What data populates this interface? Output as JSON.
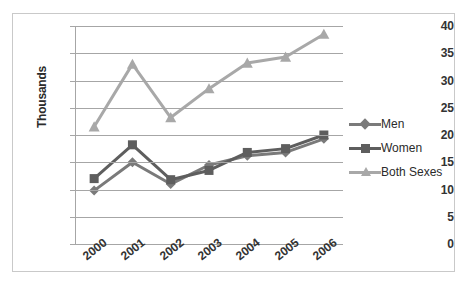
{
  "chart_data": {
    "type": "line",
    "title": "",
    "xlabel": "",
    "ylabel": "Thousands",
    "categories": [
      "2000",
      "2001",
      "2002",
      "2003",
      "2004",
      "2005",
      "2006"
    ],
    "ylim": [
      0,
      40
    ],
    "ytick_step": 5,
    "yticks": [
      "0",
      "5",
      "10",
      "15",
      "20",
      "25",
      "30",
      "35",
      "40"
    ],
    "grid": true,
    "legend_position": "right",
    "series": [
      {
        "name": "Men",
        "marker": "diamond",
        "color": "#7a7a7a",
        "values": [
          9.8,
          15.0,
          11.0,
          14.5,
          16.2,
          16.8,
          19.3
        ]
      },
      {
        "name": "Women",
        "marker": "square",
        "color": "#5e5e5e",
        "values": [
          12.0,
          18.2,
          11.8,
          13.5,
          16.8,
          17.5,
          20.0
        ]
      },
      {
        "name": "Both Sexes",
        "marker": "triangle",
        "color": "#a8a8a8",
        "values": [
          21.5,
          33.0,
          23.2,
          28.5,
          33.2,
          34.3,
          38.5
        ]
      }
    ]
  },
  "colors": {
    "men": "#7a7a7a",
    "women": "#5e5e5e",
    "both_sexes": "#a8a8a8",
    "grid": "#a6a6a6",
    "border": "#c9c9c9",
    "text": "#333333"
  },
  "legend": {
    "items": [
      {
        "label": "Men",
        "icon": "diamond-marker-icon"
      },
      {
        "label": "Women",
        "icon": "square-marker-icon"
      },
      {
        "label": "Both Sexes",
        "icon": "triangle-marker-icon"
      }
    ]
  }
}
